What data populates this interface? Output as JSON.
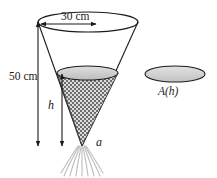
{
  "figure": {
    "labels": {
      "top_diameter": "30 cm",
      "cone_height": "50 cm",
      "depth": "h",
      "tip": "a",
      "cross_section_area": "A(h)"
    },
    "colors": {
      "outline": "#1a1a1a",
      "mesh_dark": "#6e6e6e",
      "mesh_light": "#d8d8d8",
      "surface_fill": "#cfcfcf",
      "area_fill": "#d2d2d2",
      "fringe": "#b8b8b8",
      "background": "#ffffff"
    },
    "geometry": {
      "top_ellipse": {
        "cx": 88,
        "cy": 22,
        "rx": 50,
        "ry": 10
      },
      "inner_ellipse": {
        "cx": 87.5,
        "cy": 73,
        "rx": 30.5,
        "ry": 7
      },
      "area_ellipse": {
        "cx": 175,
        "cy": 74,
        "rx": 30,
        "ry": 8
      },
      "apex": {
        "x": 82,
        "y": 146
      }
    }
  }
}
